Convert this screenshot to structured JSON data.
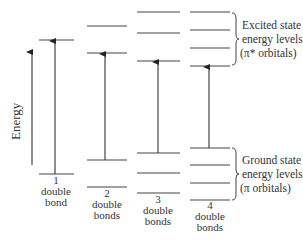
{
  "axis": {
    "label": "Energy"
  },
  "columns": [
    {
      "number": "1",
      "line2": "double",
      "line3": "bond",
      "excited_levels": 1,
      "ground_levels": 1
    },
    {
      "number": "2",
      "line2": "double",
      "line3": "bonds",
      "excited_levels": 2,
      "ground_levels": 2
    },
    {
      "number": "3",
      "line2": "double",
      "line3": "bonds",
      "excited_levels": 3,
      "ground_levels": 3
    },
    {
      "number": "4",
      "line2": "double",
      "line3": "bonds",
      "excited_levels": 4,
      "ground_levels": 4
    }
  ],
  "excited_label": {
    "line1": "Excited state",
    "line2": "energy levels",
    "line3": "(π* orbitals)"
  },
  "ground_label": {
    "line1": "Ground state",
    "line2": "energy levels",
    "line3": "(π orbitals)"
  }
}
